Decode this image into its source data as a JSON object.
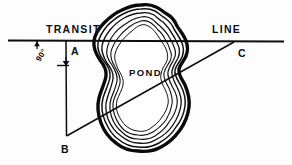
{
  "diagram": {
    "background_color": "#fdfdfd",
    "ink_color": "#0d0d0d",
    "width": 292,
    "height": 165
  },
  "labels": {
    "transit": "TRANSIT",
    "line": "LINE",
    "pond": "POND",
    "angle": "90°",
    "point_a": "A",
    "point_b": "B",
    "point_c": "C"
  },
  "geometry": {
    "transit_line": {
      "name": "transit-line",
      "x1": 8,
      "y1": 40,
      "x2": 284,
      "y2": 41,
      "stroke_width": 2.1
    },
    "offset_line_ab": {
      "name": "offset-line-ab",
      "x1": 66,
      "y1": 40,
      "x2": 66.5,
      "y2": 136,
      "stroke_width": 1.5
    },
    "sight_line_bc": {
      "name": "sight-line-bc",
      "x1": 66.5,
      "y1": 136,
      "x2": 234,
      "y2": 42,
      "stroke_width": 1.5
    },
    "angle_ticks": [
      {
        "name": "angle-tick-upper",
        "x": 37,
        "y_top": 40,
        "y_bottom": 48
      },
      {
        "name": "angle-tick-lower",
        "x": 66,
        "y_top": 66,
        "y_bottom": 58
      }
    ],
    "points": [
      {
        "name": "point-a",
        "label": "A",
        "x": 66,
        "y": 40,
        "label_x": 71,
        "label_y": 54
      },
      {
        "name": "point-b",
        "label": "B",
        "x": 66.5,
        "y": 136,
        "label_x": 62,
        "label_y": 152
      },
      {
        "name": "point-c",
        "label": "C",
        "x": 234,
        "y": 42,
        "label_x": 238,
        "label_y": 56
      }
    ],
    "pond": {
      "name": "pond-outline",
      "bounds": {
        "left": 95,
        "right": 191,
        "top": 4,
        "bottom": 152
      },
      "contour_count": 6,
      "label_x": 129,
      "label_y": 75
    }
  },
  "text_positions": {
    "transit_x": 46,
    "transit_y": 33,
    "line_x": 212,
    "line_y": 33,
    "angle_x": 42,
    "angle_y": 60
  }
}
